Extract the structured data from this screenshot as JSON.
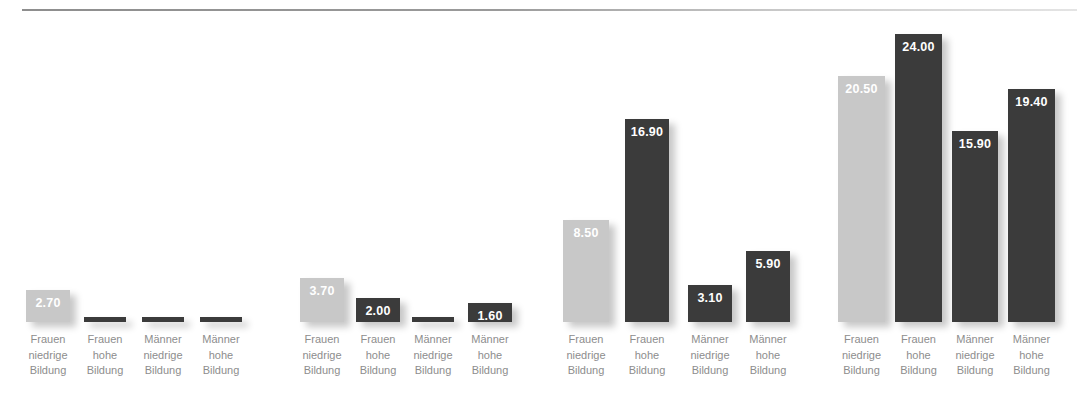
{
  "chart_data": {
    "type": "bar",
    "title": "",
    "subtitle": "",
    "xlabel": "",
    "ylabel": "",
    "grid": false,
    "legend": "none",
    "ylim": [
      0,
      24
    ],
    "value_format": "0.00",
    "categories": [
      "Frauen\nniedrige\nBildung",
      "Frauen\nhohe\nBildung",
      "Männer\nniedrige\nBildung",
      "Männer\nhohe\nBildung"
    ],
    "group_count": 4,
    "colors": {
      "light_bar": "#c8c8c8",
      "dark_bar": "#3b3b3b",
      "value_label": "#ffffff",
      "category_label": "#8d8d8d",
      "background": "#ffffff",
      "rule": "#8e8e8e"
    },
    "groups": [
      {
        "index": 1,
        "bars": [
          {
            "category": "Frauen\nniedrige\nBildung",
            "value": 2.7,
            "label": "2.70",
            "label_visible": true,
            "color": "light"
          },
          {
            "category": "Frauen\nhohe\nBildung",
            "value": 0.15,
            "label": "",
            "label_visible": false,
            "color": "dark"
          },
          {
            "category": "Männer\nniedrige\nBildung",
            "value": 0.15,
            "label": "",
            "label_visible": false,
            "color": "dark"
          },
          {
            "category": "Männer\nhohe\nBildung",
            "value": 0.15,
            "label": "",
            "label_visible": false,
            "color": "dark"
          }
        ]
      },
      {
        "index": 2,
        "bars": [
          {
            "category": "Frauen\nniedrige\nBildung",
            "value": 3.7,
            "label": "3.70",
            "label_visible": true,
            "color": "light"
          },
          {
            "category": "Frauen\nhohe\nBildung",
            "value": 2.0,
            "label": "2.00",
            "label_visible": true,
            "color": "dark"
          },
          {
            "category": "Männer\nniedrige\nBildung",
            "value": 0.15,
            "label": "",
            "label_visible": false,
            "color": "dark"
          },
          {
            "category": "Männer\nhohe\nBildung",
            "value": 1.6,
            "label": "1.60",
            "label_visible": true,
            "color": "dark"
          }
        ]
      },
      {
        "index": 3,
        "bars": [
          {
            "category": "Frauen\nniedrige\nBildung",
            "value": 8.5,
            "label": "8.50",
            "label_visible": true,
            "color": "light"
          },
          {
            "category": "Frauen\nhohe\nBildung",
            "value": 16.9,
            "label": "16.90",
            "label_visible": true,
            "color": "dark"
          },
          {
            "category": "Männer\nniedrige\nBildung",
            "value": 3.1,
            "label": "3.10",
            "label_visible": true,
            "color": "dark"
          },
          {
            "category": "Männer\nhohe\nBildung",
            "value": 5.9,
            "label": "5.90",
            "label_visible": true,
            "color": "dark"
          }
        ]
      },
      {
        "index": 4,
        "bars": [
          {
            "category": "Frauen\nniedrige\nBildung",
            "value": 20.5,
            "label": "20.50",
            "label_visible": true,
            "color": "light"
          },
          {
            "category": "Frauen\nhohe\nBildung",
            "value": 24.0,
            "label": "24.00",
            "label_visible": true,
            "color": "dark"
          },
          {
            "category": "Männer\nniedrige\nBildung",
            "value": 15.9,
            "label": "15.90",
            "label_visible": true,
            "color": "dark"
          },
          {
            "category": "Männer\nhohe\nBildung",
            "value": 19.4,
            "label": "19.40",
            "label_visible": true,
            "color": "dark"
          }
        ]
      }
    ]
  },
  "layout": {
    "group_x": [
      26,
      300,
      563,
      838
    ],
    "group_bar_x": [
      [
        0,
        58,
        116,
        174
      ],
      [
        0,
        56,
        112,
        168
      ],
      [
        0,
        62,
        125,
        183
      ],
      [
        0,
        57,
        114,
        170
      ]
    ],
    "bar_widths": [
      [
        44,
        42,
        42,
        42
      ],
      [
        44,
        44,
        42,
        44
      ],
      [
        46,
        44,
        44,
        44
      ],
      [
        47,
        47,
        46,
        47
      ]
    ],
    "baseline_y": 322,
    "px_per_unit": 12.0,
    "min_bar_px": 5
  }
}
